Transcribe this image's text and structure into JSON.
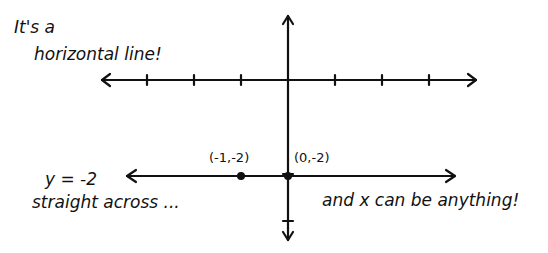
{
  "notes": {
    "title_line1": "It's a",
    "title_line2": "horizontal line!",
    "equation": "y = -2",
    "straight": "straight across ...",
    "anything": "and x can be anything!"
  },
  "points": [
    {
      "x": -1,
      "y": -2,
      "label": "(-1,-2)"
    },
    {
      "x": 0,
      "y": -2,
      "label": "(0,-2)"
    }
  ],
  "axes": {
    "x_ticks": [
      -3,
      -2,
      -1,
      1,
      2,
      3
    ],
    "y_ticks": [
      2,
      -2,
      -3
    ]
  },
  "line": {
    "equation": "y = -2",
    "y_value": -2,
    "x_from": -3.4,
    "x_to": 3.6
  },
  "colors": {
    "ink": "#111111",
    "paper": "#ffffff"
  }
}
